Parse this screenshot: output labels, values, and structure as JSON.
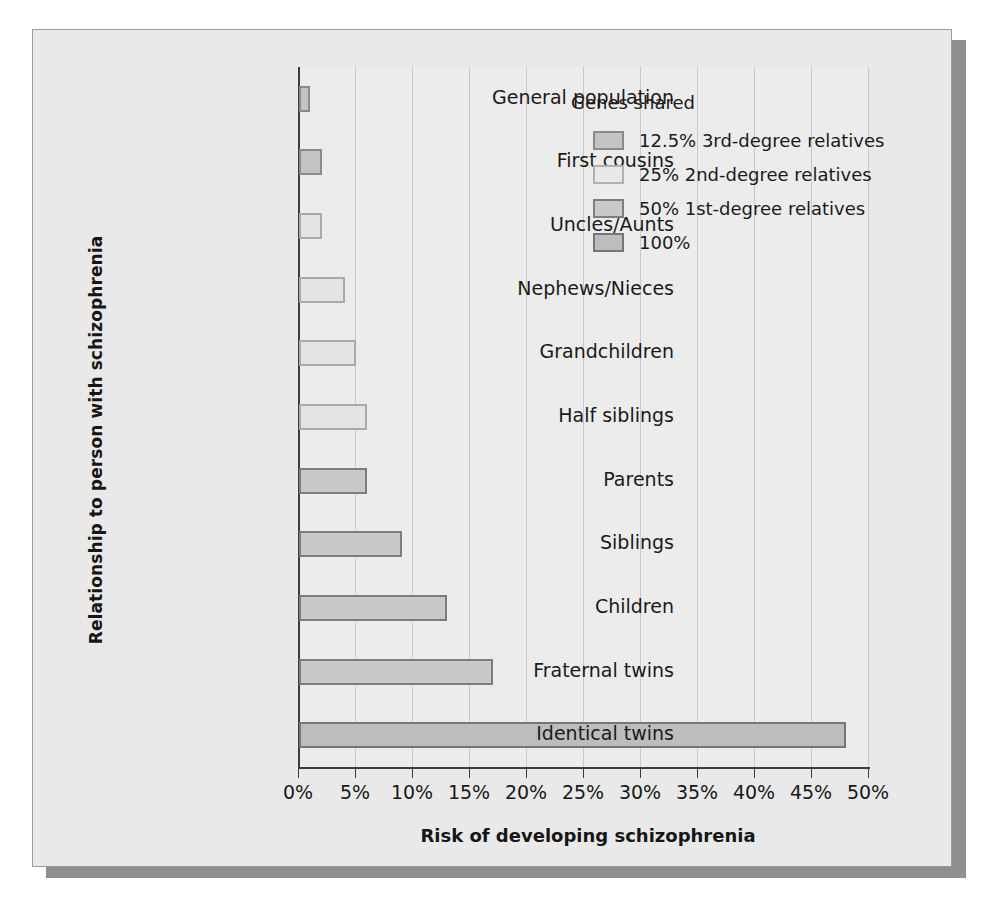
{
  "chart_data": {
    "type": "bar",
    "orientation": "horizontal",
    "title": "",
    "xlabel": "Risk of developing schizophrenia",
    "ylabel": "Relationship to person with schizophrenia",
    "xlim": [
      0,
      50
    ],
    "xtick_labels": [
      "0%",
      "5%",
      "10%",
      "15%",
      "20%",
      "25%",
      "30%",
      "35%",
      "40%",
      "45%",
      "50%"
    ],
    "xticks": [
      0,
      5,
      10,
      15,
      20,
      25,
      30,
      35,
      40,
      45,
      50
    ],
    "grid": true,
    "legend_position": "top-right",
    "categories": [
      "General population",
      "First cousins",
      "Uncles/Aunts",
      "Nephews/Nieces",
      "Grandchildren",
      "Half siblings",
      "Parents",
      "Siblings",
      "Children",
      "Fraternal twins",
      "Identical twins"
    ],
    "values": [
      1,
      2,
      2,
      4,
      5,
      6,
      6,
      9,
      13,
      17,
      48
    ],
    "value_labels": [
      "1%",
      "2%",
      "2%",
      "4%",
      "5%",
      "6%",
      "6%",
      "9%",
      "13%",
      "17%",
      "48%"
    ],
    "group_by_category": [
      "12.5% 3rd-degree relatives",
      "12.5% 3rd-degree relatives",
      "25% 2nd-degree relatives",
      "25% 2nd-degree relatives",
      "25% 2nd-degree relatives",
      "25% 2nd-degree relatives",
      "50% 1st-degree relatives",
      "50% 1st-degree relatives",
      "50% 1st-degree relatives",
      "50% 1st-degree relatives",
      "100%"
    ],
    "bar_shade_keys": [
      "shade-125",
      "shade-125",
      "shade-25",
      "shade-25",
      "shade-25",
      "shade-25",
      "shade-50",
      "shade-50",
      "shade-50",
      "shade-50",
      "shade-100"
    ]
  },
  "legend": {
    "title": "Genes shared",
    "entries": [
      {
        "label": "12.5% 3rd-degree relatives",
        "shade_key": "shade-125",
        "color": "#c3c3c3"
      },
      {
        "label": "25% 2nd-degree relatives",
        "shade_key": "shade-25",
        "color": "#e9e9e9"
      },
      {
        "label": "50% 1st-degree relatives",
        "shade_key": "shade-50",
        "color": "#c9c9c9"
      },
      {
        "label": "100%",
        "shade_key": "shade-100",
        "color": "#bdbdbd"
      }
    ]
  },
  "colors": {
    "panel_background": "#e9e9e9",
    "plot_background": "#ececec",
    "panel_border": "#9a9a9a",
    "shadow": "#8f8f8f",
    "axis": "#3d3d3d",
    "gridline": "#c9c9c9",
    "text": "#1a1a1a"
  }
}
